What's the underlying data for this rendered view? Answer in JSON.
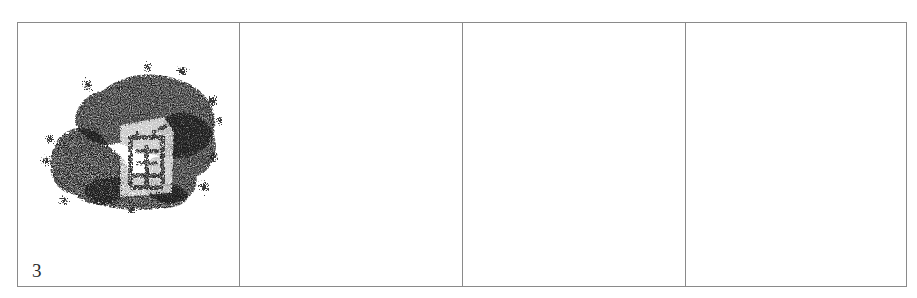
{
  "page": {
    "background_color": "#ffffff",
    "width": 917,
    "height": 298
  },
  "table": {
    "name": "specimen-comparison-table",
    "border_color": "#8a8a8a",
    "rows": 1,
    "columns": 4,
    "cells": [
      {
        "index": 1,
        "label": "3",
        "content_type": "ink-rubbing",
        "content_description": "ink rubbing of a seal-script character impression",
        "ink_color": "#1a1a1a",
        "empty": false
      },
      {
        "index": 2,
        "label": "",
        "content_type": "empty",
        "content_description": "",
        "ink_color": "",
        "empty": true
      },
      {
        "index": 3,
        "label": "",
        "content_type": "empty",
        "content_description": "",
        "ink_color": "",
        "empty": true
      },
      {
        "index": 4,
        "label": "",
        "content_type": "empty",
        "content_description": "",
        "ink_color": "",
        "empty": true
      }
    ]
  }
}
